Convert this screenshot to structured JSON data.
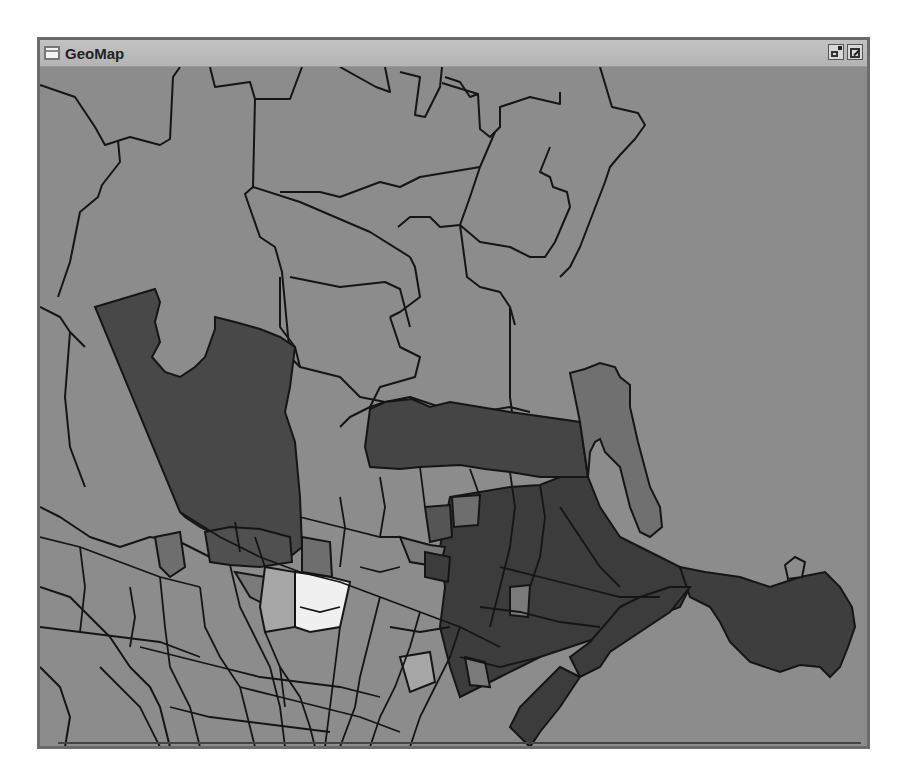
{
  "window": {
    "title": "GeoMap",
    "buttons": [
      {
        "name": "restore",
        "icon": "restore-window-icon"
      },
      {
        "name": "detach",
        "icon": "detach-window-icon"
      }
    ]
  },
  "map": {
    "type": "choropleth",
    "background_color": "#8c8c8c",
    "boundary_color": "#111111",
    "legend": null,
    "shade_classes": [
      {
        "name": "highest",
        "color": "#f0f0f0"
      },
      {
        "name": "light",
        "color": "#a6a6a6"
      },
      {
        "name": "base",
        "color": "#8c8c8c"
      },
      {
        "name": "medium",
        "color": "#6e6e6e"
      },
      {
        "name": "dark",
        "color": "#484848"
      },
      {
        "name": "darkest",
        "color": "#3a3a3a"
      }
    ]
  }
}
